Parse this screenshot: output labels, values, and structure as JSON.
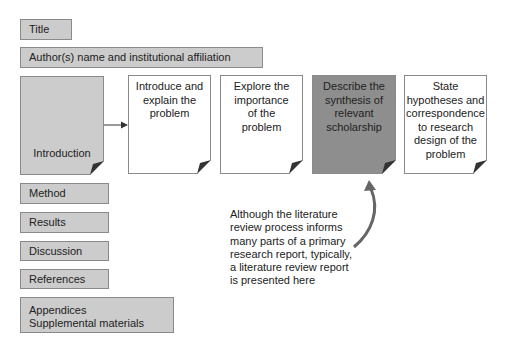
{
  "boxes": {
    "title": "Title",
    "authors": "Author(s) name and institutional affiliation",
    "introduction": "Introduction",
    "method": "Method",
    "results": "Results",
    "discussion": "Discussion",
    "references": "References",
    "appendices_line1": "Appendices",
    "appendices_line2": "Supplemental materials"
  },
  "intro_steps": [
    {
      "line1": "Introduce and",
      "line2": "explain the",
      "line3": "problem",
      "line4": "",
      "line5": "",
      "line6": ""
    },
    {
      "line1": "Explore the",
      "line2": "importance",
      "line3": "of the",
      "line4": "problem",
      "line5": "",
      "line6": ""
    },
    {
      "line1": "Describe the",
      "line2": "synthesis of",
      "line3": "relevant",
      "line4": "scholarship",
      "line5": "",
      "line6": ""
    },
    {
      "line1": "State",
      "line2": "hypotheses and",
      "line3": "correspondence",
      "line4": "to research",
      "line5": "design of the",
      "line6": "problem"
    }
  ],
  "note": {
    "line1": "Although the literature",
    "line2": "review process informs",
    "line3": "many parts of a primary",
    "line4": "research report, typically,",
    "line5": "a literature review report",
    "line6": "is presented here"
  },
  "colors": {
    "box_grey": "#cccccc",
    "box_dark": "#8e8e8e",
    "border": "#8a8a8a",
    "arrow": "#555555"
  }
}
